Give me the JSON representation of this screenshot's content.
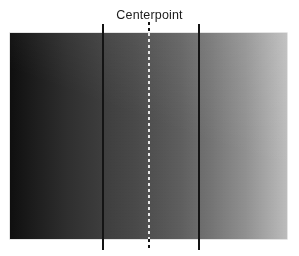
{
  "figure": {
    "title": "Centerpoint",
    "background_color": "#ffffff"
  },
  "chart_data": {
    "type": "heatmap",
    "title": "Centerpoint",
    "xlabel": "",
    "ylabel": "",
    "orientation": "horizontal",
    "grid": false,
    "legend": false,
    "swatch": {
      "left_color": "#0f0f0f",
      "right_color": "#bcbcbc",
      "x_start_px": 10,
      "x_end_px": 287,
      "y_start_px": 33,
      "y_end_px": 239
    },
    "gradient_stops": [
      {
        "position_pct": 0,
        "color": "#0f0f0f",
        "gray_value": 15
      },
      {
        "position_pct": 9,
        "color": "#1d1d1d",
        "gray_value": 29
      },
      {
        "position_pct": 21,
        "color": "#2f2f2f",
        "gray_value": 47
      },
      {
        "position_pct": 33,
        "color": "#3d3d3d",
        "gray_value": 61
      },
      {
        "position_pct": 45,
        "color": "#494949",
        "gray_value": 73
      },
      {
        "position_pct": 50,
        "color": "#4f4f4f",
        "gray_value": 79
      },
      {
        "position_pct": 62,
        "color": "#5f5f5f",
        "gray_value": 95
      },
      {
        "position_pct": 73,
        "color": "#757575",
        "gray_value": 117
      },
      {
        "position_pct": 85,
        "color": "#909090",
        "gray_value": 144
      },
      {
        "position_pct": 96,
        "color": "#b0b0b0",
        "gray_value": 176
      },
      {
        "position_pct": 100,
        "color": "#bcbcbc",
        "gray_value": 188
      }
    ],
    "annotations": [
      {
        "name": "left-boundary-line",
        "style": "solid",
        "x_px": 102,
        "color": "#141414",
        "label": ""
      },
      {
        "name": "centerpoint-line",
        "style": "dashed",
        "x_px": 148,
        "color": "#141414",
        "label": "Centerpoint"
      },
      {
        "name": "right-boundary-line",
        "style": "solid",
        "x_px": 198,
        "color": "#141414",
        "label": ""
      }
    ]
  }
}
